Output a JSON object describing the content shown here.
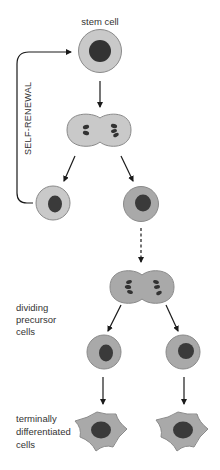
{
  "labels": {
    "stem_cell": "stem cell",
    "self_renewal": "SELF-RENEWAL",
    "dividing_precursor": [
      "dividing",
      "precursor",
      "cells"
    ],
    "terminally_differentiated": [
      "terminally",
      "differentiated",
      "cells"
    ]
  },
  "colors": {
    "cytoplasm_light": "#c9c9c9",
    "cytoplasm_dark": "#a9a9a9",
    "cell_outline": "#8a8a8a",
    "nucleus": "#3a3a3a",
    "arrow": "#1a1a1a",
    "text": "#333333"
  },
  "nodes": [
    {
      "id": "stem-cell",
      "type": "round-cell",
      "shade": "light"
    },
    {
      "id": "dividing-stem-cell",
      "type": "dividing-cell",
      "shade": "light"
    },
    {
      "id": "renewed-stem-cell",
      "type": "round-cell",
      "shade": "light"
    },
    {
      "id": "committed-cell",
      "type": "round-cell",
      "shade": "dark"
    },
    {
      "id": "dividing-precursor-cell",
      "type": "dividing-cell",
      "shade": "dark"
    },
    {
      "id": "precursor-cell-left",
      "type": "round-cell",
      "shade": "dark"
    },
    {
      "id": "precursor-cell-right",
      "type": "round-cell",
      "shade": "dark"
    },
    {
      "id": "differentiated-cell-left",
      "type": "stellate-cell",
      "shade": "dark"
    },
    {
      "id": "differentiated-cell-right",
      "type": "stellate-cell",
      "shade": "dark"
    }
  ],
  "edges": [
    {
      "from": "stem-cell",
      "to": "dividing-stem-cell",
      "style": "solid"
    },
    {
      "from": "dividing-stem-cell",
      "to": "renewed-stem-cell",
      "style": "solid"
    },
    {
      "from": "dividing-stem-cell",
      "to": "committed-cell",
      "style": "solid"
    },
    {
      "from": "renewed-stem-cell",
      "to": "stem-cell",
      "style": "solid",
      "label": "SELF-RENEWAL"
    },
    {
      "from": "committed-cell",
      "to": "dividing-precursor-cell",
      "style": "dashed"
    },
    {
      "from": "dividing-precursor-cell",
      "to": "precursor-cell-left",
      "style": "solid"
    },
    {
      "from": "dividing-precursor-cell",
      "to": "precursor-cell-right",
      "style": "solid"
    },
    {
      "from": "precursor-cell-left",
      "to": "differentiated-cell-left",
      "style": "solid"
    },
    {
      "from": "precursor-cell-right",
      "to": "differentiated-cell-right",
      "style": "solid"
    }
  ]
}
